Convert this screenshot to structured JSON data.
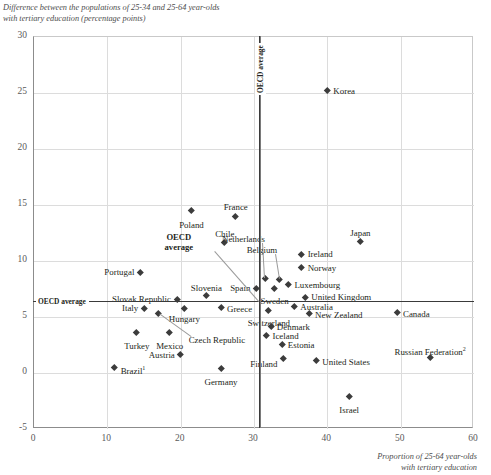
{
  "chart_data": {
    "type": "scatter",
    "title": "",
    "ylabel": "Difference between the populations of 25-34 and 25-64 year-olds\nwith tertiary education (percentage points)",
    "xlabel": "Proportion of 25-64 year-olds\nwith tertiary education",
    "xlim": [
      0,
      60
    ],
    "ylim": [
      -5,
      30
    ],
    "xticks": [
      0,
      10,
      20,
      30,
      40,
      50,
      60
    ],
    "yticks": [
      -5,
      0,
      5,
      10,
      15,
      20,
      25,
      30
    ],
    "grid": true,
    "legend": "none",
    "reference_lines": {
      "vertical": {
        "label": "OECD average",
        "value": 30.8
      },
      "horizontal": {
        "label": "OECD average",
        "value": 6.3
      }
    },
    "oecd_average_point": {
      "label": "OECD\naverage",
      "x": 30.8,
      "y": 6.3
    },
    "points": [
      {
        "name": "Korea",
        "x": 40.0,
        "y": 25.2,
        "lx": 6,
        "ly": -4,
        "anchor": "left"
      },
      {
        "name": "France",
        "x": 27.5,
        "y": 14.0,
        "lx": 0,
        "ly": -13,
        "anchor": "center"
      },
      {
        "name": "Poland",
        "x": 21.5,
        "y": 14.5,
        "lx": 0,
        "ly": 10,
        "anchor": "center"
      },
      {
        "name": "Chile",
        "x": 26.0,
        "y": 11.7,
        "lx": 0,
        "ly": -12,
        "anchor": "center"
      },
      {
        "name": "Japan",
        "x": 44.5,
        "y": 11.8,
        "lx": 0,
        "ly": -12,
        "anchor": "center"
      },
      {
        "name": "Netherlands",
        "x": 31.5,
        "y": 8.5,
        "lx": 0,
        "ly": -43,
        "anchor": "leader-left"
      },
      {
        "name": "Belgium",
        "x": 33.5,
        "y": 8.4,
        "lx": -2,
        "ly": -33,
        "anchor": "leader-left"
      },
      {
        "name": "Ireland",
        "x": 36.5,
        "y": 10.6,
        "lx": 6,
        "ly": -4,
        "anchor": "left"
      },
      {
        "name": "Norway",
        "x": 36.5,
        "y": 9.4,
        "lx": 6,
        "ly": -4,
        "anchor": "left"
      },
      {
        "name": "Luxembourg",
        "x": 34.7,
        "y": 7.9,
        "lx": 6,
        "ly": -4,
        "anchor": "left"
      },
      {
        "name": "United Kingdom",
        "x": 37.0,
        "y": 6.8,
        "lx": 6,
        "ly": -4,
        "anchor": "left"
      },
      {
        "name": "Portugal",
        "x": 14.5,
        "y": 9.0,
        "lx": -6,
        "ly": -4,
        "anchor": "right"
      },
      {
        "name": "Spain",
        "x": 30.3,
        "y": 7.6,
        "lx": -6,
        "ly": -4,
        "anchor": "right"
      },
      {
        "name": "Sweden",
        "x": 32.8,
        "y": 7.6,
        "lx": 0,
        "ly": 9,
        "anchor": "center"
      },
      {
        "name": "Slovenia",
        "x": 23.5,
        "y": 6.9,
        "lx": 0,
        "ly": -12,
        "anchor": "center"
      },
      {
        "name": "Slovak Republic",
        "x": 19.5,
        "y": 6.6,
        "lx": -6,
        "ly": -4,
        "anchor": "right"
      },
      {
        "name": "Italy",
        "x": 15.0,
        "y": 5.8,
        "lx": -6,
        "ly": -4,
        "anchor": "right"
      },
      {
        "name": "Greece",
        "x": 25.5,
        "y": 5.9,
        "lx": 6,
        "ly": -2,
        "anchor": "left"
      },
      {
        "name": "Hungary",
        "x": 20.5,
        "y": 5.8,
        "lx": 0,
        "ly": 7,
        "anchor": "center"
      },
      {
        "name": "Czech Republic",
        "x": 17.0,
        "y": 5.3,
        "lx": 30,
        "ly": 22,
        "anchor": "leader-right"
      },
      {
        "name": "Switzerland",
        "x": 32.0,
        "y": 5.6,
        "lx": 0,
        "ly": 9,
        "anchor": "center"
      },
      {
        "name": "Australia",
        "x": 35.5,
        "y": 6.0,
        "lx": 6,
        "ly": -3,
        "anchor": "left"
      },
      {
        "name": "New Zealand",
        "x": 37.5,
        "y": 5.3,
        "lx": 6,
        "ly": -3,
        "anchor": "left"
      },
      {
        "name": "Canada",
        "x": 49.5,
        "y": 5.4,
        "lx": 6,
        "ly": -3,
        "anchor": "left"
      },
      {
        "name": "Turkey",
        "x": 14.0,
        "y": 3.6,
        "lx": 0,
        "ly": 9,
        "anchor": "center"
      },
      {
        "name": "Mexico",
        "x": 18.5,
        "y": 3.6,
        "lx": 0,
        "ly": 9,
        "anchor": "center"
      },
      {
        "name": "Denmark",
        "x": 32.3,
        "y": 4.2,
        "lx": 6,
        "ly": -3,
        "anchor": "left"
      },
      {
        "name": "Iceland",
        "x": 31.7,
        "y": 3.4,
        "lx": 6,
        "ly": -3,
        "anchor": "left"
      },
      {
        "name": "Estonia",
        "x": 33.8,
        "y": 2.6,
        "lx": 6,
        "ly": -3,
        "anchor": "left"
      },
      {
        "name": "Austria",
        "x": 20.0,
        "y": 1.7,
        "lx": -6,
        "ly": -3,
        "anchor": "right"
      },
      {
        "name": "Finland",
        "x": 34.0,
        "y": 1.3,
        "lx": -6,
        "ly": 2,
        "anchor": "right"
      },
      {
        "name": "United States",
        "x": 38.5,
        "y": 1.1,
        "lx": 6,
        "ly": -3,
        "anchor": "left"
      },
      {
        "name": "Russian Federation",
        "x": 54.0,
        "y": 1.4,
        "lx": 0,
        "ly": -12,
        "anchor": "center",
        "sup": "2"
      },
      {
        "name": "Brazil",
        "x": 11.0,
        "y": 0.5,
        "lx": 6,
        "ly": -3,
        "anchor": "left",
        "sup": "1"
      },
      {
        "name": "Germany",
        "x": 25.5,
        "y": 0.4,
        "lx": 0,
        "ly": 9,
        "anchor": "center"
      },
      {
        "name": "Israel",
        "x": 43.0,
        "y": -2.1,
        "lx": 0,
        "ly": 9,
        "anchor": "center"
      }
    ]
  }
}
